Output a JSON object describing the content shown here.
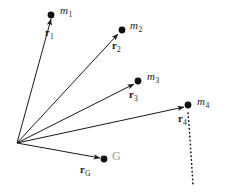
{
  "figure": {
    "background_color": "#ffffff",
    "stroke_color": "#1a1a1a",
    "gray_label_color": "#9a9a9a",
    "width": 225,
    "height": 192
  },
  "origin": {
    "label": "origin",
    "x": 17,
    "y": 143
  },
  "vectors": [
    {
      "id": "r1",
      "vector_label": "r",
      "vector_subscript": "1",
      "point_label": "m",
      "point_subscript": "1",
      "tip_x": 51,
      "tip_y": 19,
      "dot_x": 51,
      "dot_y": 15,
      "point_label_x": 60,
      "point_label_y": 5,
      "vector_label_x": 45,
      "vector_label_y": 28
    },
    {
      "id": "r2",
      "vector_label": "r",
      "vector_subscript": "2",
      "point_label": "m",
      "point_subscript": "2",
      "tip_x": 118,
      "tip_y": 34,
      "dot_x": 122,
      "dot_y": 30,
      "point_label_x": 130,
      "point_label_y": 20,
      "vector_label_x": 112,
      "vector_label_y": 41
    },
    {
      "id": "r3",
      "vector_label": "r",
      "vector_subscript": "3",
      "point_label": "m",
      "point_subscript": "3",
      "tip_x": 134,
      "tip_y": 84,
      "dot_x": 138,
      "dot_y": 81,
      "point_label_x": 147,
      "point_label_y": 71,
      "vector_label_x": 129,
      "vector_label_y": 90
    },
    {
      "id": "r4",
      "vector_label": "r",
      "vector_subscript": "4",
      "point_label": "m",
      "point_subscript": "4",
      "tip_x": 184,
      "tip_y": 107,
      "dot_x": 188,
      "dot_y": 105,
      "point_label_x": 197,
      "point_label_y": 96,
      "vector_label_x": 178,
      "vector_label_y": 114
    },
    {
      "id": "rG",
      "vector_label": "r",
      "vector_subscript": "G",
      "point_label": "G",
      "point_subscript": "",
      "tip_x": 100,
      "tip_y": 158,
      "dot_x": 104,
      "dot_y": 159,
      "point_label_x": 112,
      "point_label_y": 150,
      "vector_label_x": 80,
      "vector_label_y": 165
    }
  ],
  "dotted_curve": {
    "name": "body-outline-dotted-arc",
    "path": "M 188 113 L 189 130 L 190 147 L 191 162 L 192 175 L 193 186"
  }
}
